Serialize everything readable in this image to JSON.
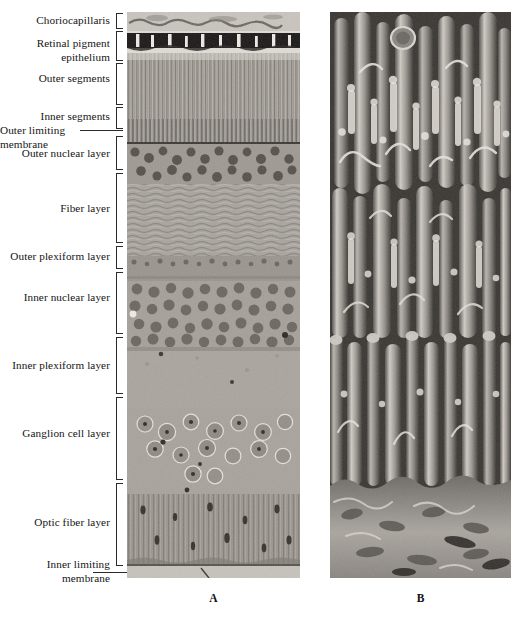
{
  "figure": {
    "panels": [
      {
        "id": "A",
        "caption": "A",
        "type": "light-micrograph-retina-cross-section"
      },
      {
        "id": "B",
        "caption": "B",
        "type": "scanning-electron-micrograph-photoreceptors"
      }
    ]
  },
  "labels": [
    {
      "id": "choriocapillaris",
      "text": "Choriocapillaris",
      "bracket": true,
      "leader": false
    },
    {
      "id": "retinal-pigment-epithelium",
      "text": "Retinal pigment\nepithelium",
      "bracket": true,
      "leader": false
    },
    {
      "id": "outer-segments",
      "text": "Outer segments",
      "bracket": true,
      "leader": false
    },
    {
      "id": "inner-segments",
      "text": "Inner segments",
      "bracket": true,
      "leader": false
    },
    {
      "id": "outer-limiting-membrane",
      "text": "Outer limiting\nmembrane",
      "bracket": false,
      "leader": true
    },
    {
      "id": "outer-nuclear-layer",
      "text": "Outer nuclear layer",
      "bracket": true,
      "leader": false
    },
    {
      "id": "fiber-layer",
      "text": "Fiber layer",
      "bracket": true,
      "leader": false
    },
    {
      "id": "outer-plexiform-layer",
      "text": "Outer plexiform layer",
      "bracket": true,
      "leader": false
    },
    {
      "id": "inner-nuclear-layer",
      "text": "Inner nuclear layer",
      "bracket": true,
      "leader": false
    },
    {
      "id": "inner-plexiform-layer",
      "text": "Inner plexiform layer",
      "bracket": true,
      "leader": false
    },
    {
      "id": "ganglion-cell-layer",
      "text": "Ganglion cell layer",
      "bracket": true,
      "leader": false
    },
    {
      "id": "optic-fiber-layer",
      "text": "Optic fiber layer",
      "bracket": true,
      "leader": false
    },
    {
      "id": "inner-limiting-membrane",
      "text": "Inner limiting\nmembrane",
      "bracket": false,
      "leader": true
    }
  ],
  "colors": {
    "background": "#ffffff",
    "text": "#141414",
    "bracket": "#2a2a2a",
    "micrograph_mid": "#8f8f8f",
    "micrograph_dark": "#2b2b2b",
    "micrograph_light": "#d8d8d8"
  }
}
